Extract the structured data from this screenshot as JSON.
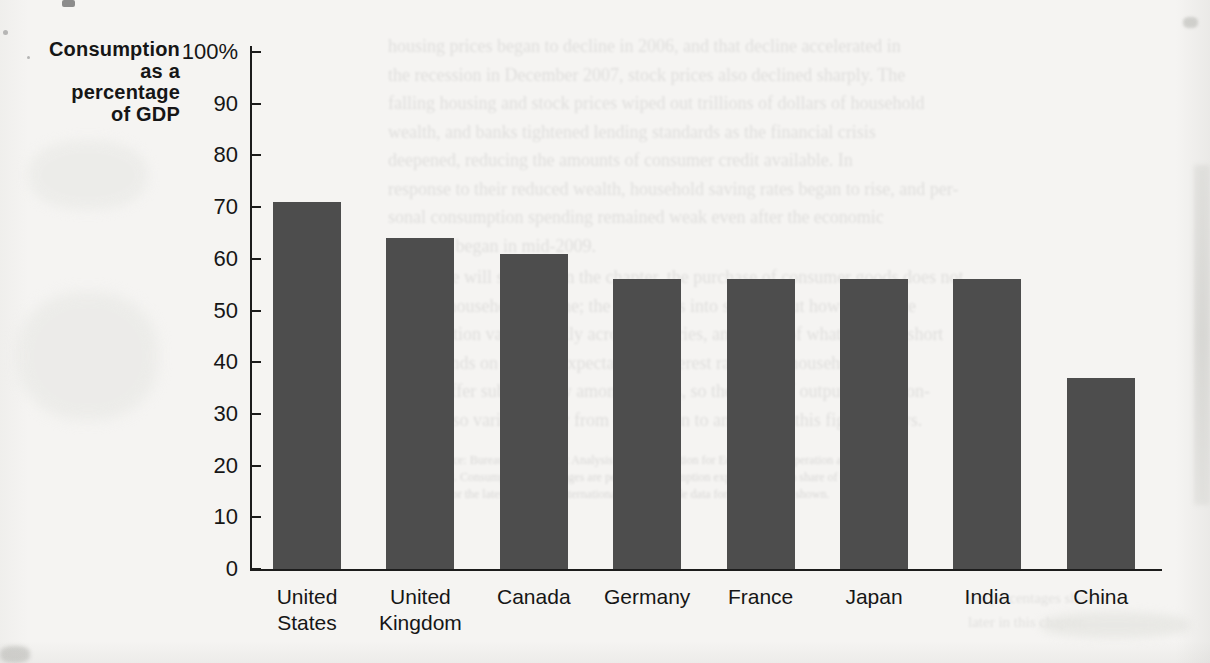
{
  "chart_data": {
    "type": "bar",
    "title": "",
    "ylabel": "Consumption as a percentage of GDP",
    "categories": [
      "United States",
      "United Kingdom",
      "Canada",
      "Germany",
      "France",
      "Japan",
      "India",
      "China"
    ],
    "values": [
      71,
      64,
      61,
      56,
      56,
      56,
      56,
      37
    ],
    "ylim": [
      0,
      100
    ],
    "ytick_step": 10,
    "grid": false,
    "legend": "none",
    "bar_color": "#4d4d4d",
    "category_label_lines": [
      [
        "United",
        "States"
      ],
      [
        "United",
        "Kingdom"
      ],
      [
        "Canada"
      ],
      [
        "Germany"
      ],
      [
        "France"
      ],
      [
        "Japan"
      ],
      [
        "India"
      ],
      [
        "China"
      ]
    ]
  },
  "figure": {
    "y_axis_title_lines": [
      "Consumption",
      "as a",
      "percentage",
      "of GDP"
    ],
    "y_ticks": [
      {
        "value": 100,
        "label": "100%"
      },
      {
        "value": 90,
        "label": "90"
      },
      {
        "value": 80,
        "label": "80"
      },
      {
        "value": 70,
        "label": "70"
      },
      {
        "value": 60,
        "label": "60"
      },
      {
        "value": 50,
        "label": "50"
      },
      {
        "value": 40,
        "label": "40"
      },
      {
        "value": 30,
        "label": "30"
      },
      {
        "value": 20,
        "label": "20"
      },
      {
        "value": 10,
        "label": "10"
      },
      {
        "value": 0,
        "label": "0"
      }
    ]
  },
  "bleedthrough_text": {
    "note": "faint reverse-page print, largely illegible",
    "paragraph1_lines": [
      "housing prices began to decline in 2006, and that decline accelerated in",
      "the recession in December 2007, stock prices also declined sharply. The",
      "falling housing and stock prices wiped out trillions of dollars of household",
      "wealth, and banks tightened lending standards as the financial crisis",
      "deepened, reducing the amounts of consumer credit available. In",
      "response to their reduced wealth, household saving rates began to rise, and per-",
      "sonal consumption spending remained weak even after the economic",
      "recovery began in mid-2009."
    ],
    "paragraph2_lines": [
      "As we will see later in the chapter, the purchase of consumer goods does not",
      "exhaust household income; the rest flows into saving. But how to finance",
      "consumption varies greatly across countries, and much of what is in the short",
      "run depends on wealth, expectations, interest rates, and household debt,",
      "which differ substantially among nations, so the share of output that is con-",
      "sumed also varies widely from one region to another, as this figure shows."
    ],
    "smallprint_lines": [
      "Source: Bureau of Economic Analysis and Organisation for Economic Co-operation and Develop-",
      "ment. Consumption percentages are personal consumption expenditures as a share of GDP and",
      "are for the latest year with internationally comparable data for the countries shown."
    ],
    "bottom_fragment_lines": [
      "the percentages shown",
      "later in this chapter."
    ]
  },
  "colors": {
    "paper": "#f5f4f2",
    "bar": "#4d4d4d",
    "axis": "#1c1c1c",
    "text": "#161616"
  }
}
